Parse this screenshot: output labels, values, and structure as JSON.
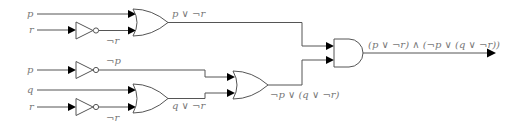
{
  "diagram": {
    "type": "logic-circuit",
    "inputs": [
      {
        "id": "in-p-top",
        "label": "p"
      },
      {
        "id": "in-r-top",
        "label": "r"
      },
      {
        "id": "in-p-bottom",
        "label": "p"
      },
      {
        "id": "in-q",
        "label": "q"
      },
      {
        "id": "in-r-bottom",
        "label": "r"
      }
    ],
    "gates": [
      {
        "id": "not-r-top",
        "type": "NOT",
        "output_label": "¬r"
      },
      {
        "id": "or-top",
        "type": "OR",
        "output_label": "p ∨ ¬r"
      },
      {
        "id": "not-p",
        "type": "NOT",
        "output_label": "¬p"
      },
      {
        "id": "not-r-bottom",
        "type": "NOT",
        "output_label": "¬r"
      },
      {
        "id": "or-q",
        "type": "OR",
        "output_label": "q ∨ ¬r"
      },
      {
        "id": "or-mid",
        "type": "OR",
        "output_label": "¬p ∨ (q ∨ ¬r)"
      },
      {
        "id": "and-final",
        "type": "AND",
        "output_label": "(p ∨ ¬r) ∧ (¬p ∨ (q ∨ ¬r))"
      }
    ],
    "colors": {
      "wire": "#555555",
      "arrow": "#000000",
      "label": "#777777"
    }
  }
}
